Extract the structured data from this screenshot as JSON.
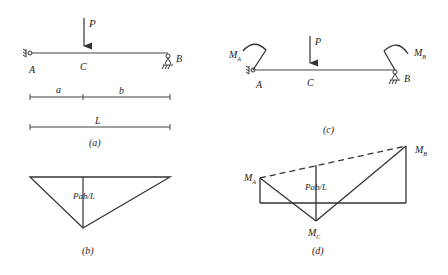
{
  "panels": {
    "a": {
      "caption": "(a)",
      "load": "P",
      "point_left": "A",
      "point_mid": "C",
      "point_right": "B",
      "dim_a": "a",
      "dim_b": "b",
      "dim_L": "L"
    },
    "b": {
      "caption": "(b)",
      "moment_label": "Pab/L"
    },
    "c": {
      "caption": "(c)",
      "load": "P",
      "point_left": "A",
      "point_mid": "C",
      "point_right": "B",
      "moment_left": "M",
      "moment_left_sub": "A",
      "moment_right": "M",
      "moment_right_sub": "B"
    },
    "d": {
      "caption": "(d)",
      "moment_label": "Pab/L",
      "label_left": "M",
      "label_left_sub": "A",
      "label_right": "M",
      "label_right_sub": "B",
      "label_mid": "M",
      "label_mid_sub": "C"
    }
  },
  "colors": {
    "line": "#333333",
    "background": "#ffffff"
  }
}
